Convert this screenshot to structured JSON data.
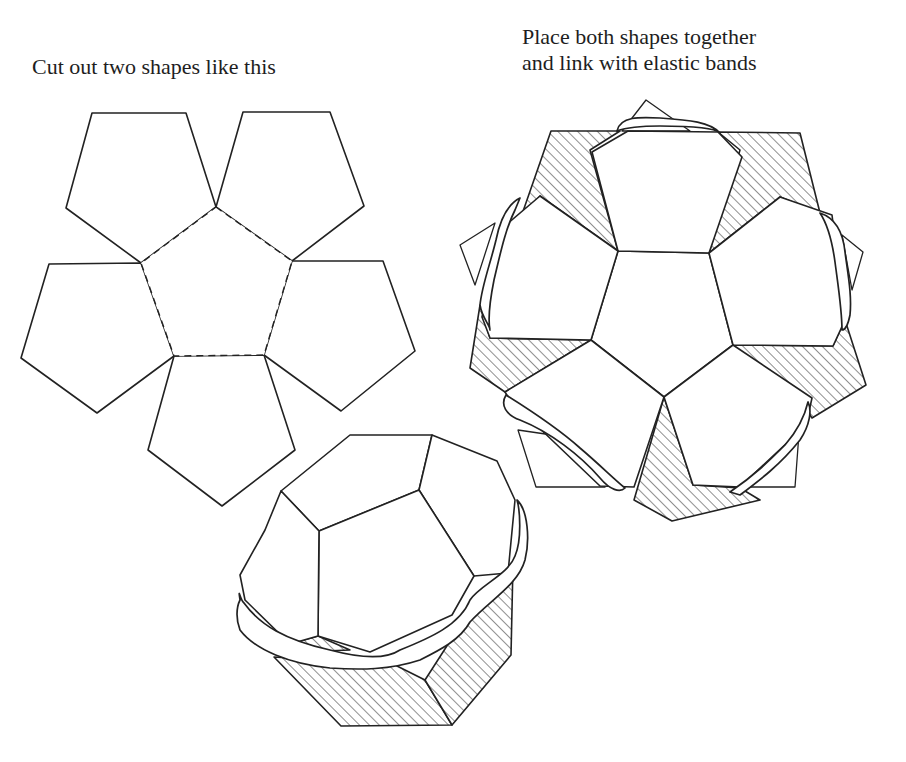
{
  "captions": {
    "left": "Cut out two shapes like this",
    "right_line1": "Place both shapes together",
    "right_line2": "and link with elastic bands"
  },
  "figures": {
    "net": {
      "label": "dodecahedron-half-net",
      "center_face": "pentagon (dashed fold lines)",
      "petal_faces": 5
    },
    "assembled_top_view": {
      "label": "two nets placed together, linked with elastic bands",
      "hatched_faces": 5
    },
    "assembled_3d": {
      "label": "partially closed dodecahedron held by elastic band"
    }
  },
  "colors": {
    "ink": "#222222",
    "background": "#ffffff"
  }
}
